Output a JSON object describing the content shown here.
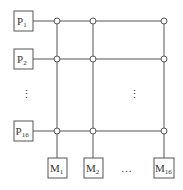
{
  "diagram": {
    "type": "crossbar-switch",
    "processors": [
      {
        "label": "P",
        "sub": "1"
      },
      {
        "label": "P",
        "sub": "2"
      },
      {
        "label": "P",
        "sub": "16"
      }
    ],
    "memories": [
      {
        "label": "M",
        "sub": "1"
      },
      {
        "label": "M",
        "sub": "2"
      },
      {
        "label": "M",
        "sub": "16"
      }
    ],
    "vertical_ellipsis": "⋮",
    "horizontal_ellipsis": "…",
    "colors": {
      "line": "#555555",
      "box": "#555555",
      "text": "#333333",
      "background": "#ffffff"
    }
  }
}
